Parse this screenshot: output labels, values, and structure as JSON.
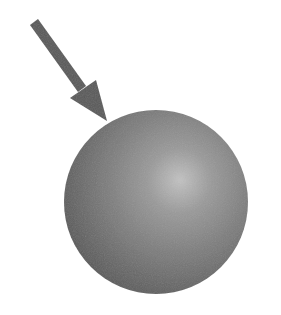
{
  "diagram": {
    "elements": [
      {
        "type": "arrow",
        "direction": "down-right",
        "color": "#5a5a5a"
      },
      {
        "type": "sphere",
        "base_color": "#6e6e6e",
        "highlight_color": "#b8b8b8",
        "edge_color": "#4f4f4f"
      }
    ]
  },
  "colors": {
    "background": "#ffffff",
    "arrow": "#5a5a5a",
    "sphere_highlight": "#bdbdbd",
    "sphere_mid": "#858585",
    "sphere_edge": "#555555"
  }
}
